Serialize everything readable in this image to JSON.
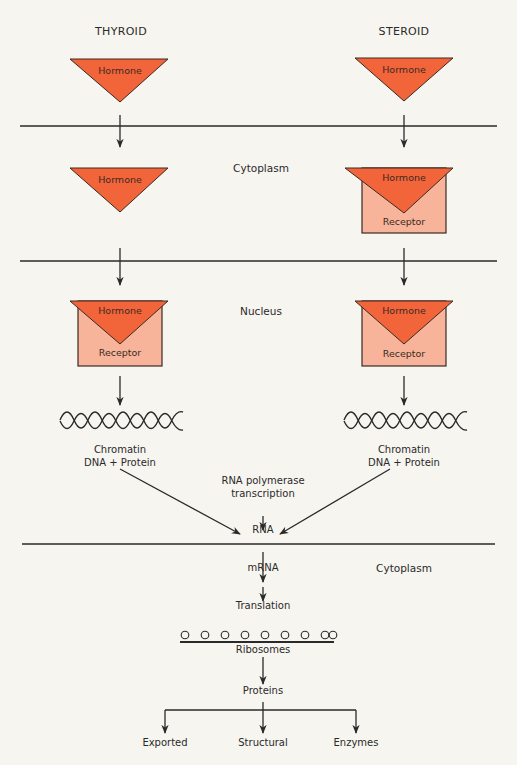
{
  "columns": {
    "left": "THYROID",
    "right": "STEROID"
  },
  "regions": {
    "cytoplasm_upper": "Cytoplasm",
    "nucleus": "Nucleus",
    "cytoplasm_lower": "Cytoplasm"
  },
  "shapes": {
    "hormone": "Hormone",
    "receptor": "Receptor"
  },
  "chromatin": {
    "line1": "Chromatin",
    "line2": "DNA + Protein"
  },
  "pathway": {
    "polymerase_line1": "RNA polymerase",
    "polymerase_line2": "transcription",
    "rna": "RNA",
    "mrna": "mRNA",
    "translation": "Translation",
    "ribosomes": "Ribosomes",
    "proteins": "Proteins"
  },
  "outputs": [
    "Exported",
    "Structural",
    "Enzymes"
  ],
  "colors": {
    "hormone": "#f2643a",
    "receptor": "#f7b49a",
    "line": "#2a2a2a",
    "background": "#f7f5f0"
  }
}
